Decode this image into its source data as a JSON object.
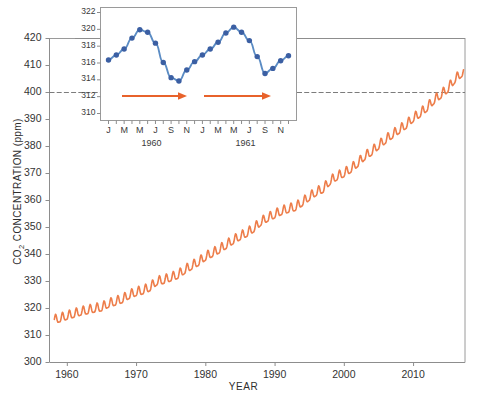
{
  "chart_data": [
    {
      "id": "main",
      "type": "line",
      "title": "",
      "xlabel": "YEAR",
      "ylabel": "CO2 CONCENTRATION (ppm)",
      "ylabel_parts": {
        "pre": "CO",
        "sub": "2",
        "post": " CONCENTRATION (ppm)"
      },
      "xlim": [
        1957.5,
        2017.5
      ],
      "ylim": [
        300,
        420
      ],
      "xticks": [
        1960,
        1970,
        1980,
        1990,
        2000,
        2010
      ],
      "xtick_labels": [
        "1960",
        "1970",
        "1980",
        "1990",
        "2000",
        "2010"
      ],
      "yticks": [
        300,
        310,
        320,
        330,
        340,
        350,
        360,
        370,
        380,
        390,
        400,
        410,
        420
      ],
      "ytick_labels": [
        "300",
        "310",
        "320",
        "330",
        "340",
        "350",
        "360",
        "370",
        "380",
        "390",
        "400",
        "410",
        "420"
      ],
      "grid": false,
      "legend": "none",
      "series_color": "#ED7D4A",
      "description": "Keeling curve: monthly mean atmospheric CO2 at Mauna Loa, rising sawtooth with annual seasonal cycle",
      "annual_trend": [
        {
          "year": 1958,
          "value": 315.3
        },
        {
          "year": 1959,
          "value": 315.98
        },
        {
          "year": 1960,
          "value": 316.91
        },
        {
          "year": 1961,
          "value": 317.64
        },
        {
          "year": 1962,
          "value": 318.45
        },
        {
          "year": 1963,
          "value": 318.99
        },
        {
          "year": 1964,
          "value": 319.62
        },
        {
          "year": 1965,
          "value": 320.04
        },
        {
          "year": 1966,
          "value": 321.37
        },
        {
          "year": 1967,
          "value": 322.18
        },
        {
          "year": 1968,
          "value": 323.05
        },
        {
          "year": 1969,
          "value": 324.62
        },
        {
          "year": 1970,
          "value": 325.68
        },
        {
          "year": 1971,
          "value": 326.32
        },
        {
          "year": 1972,
          "value": 327.46
        },
        {
          "year": 1973,
          "value": 329.68
        },
        {
          "year": 1974,
          "value": 330.19
        },
        {
          "year": 1975,
          "value": 331.12
        },
        {
          "year": 1976,
          "value": 332.03
        },
        {
          "year": 1977,
          "value": 333.84
        },
        {
          "year": 1978,
          "value": 335.41
        },
        {
          "year": 1979,
          "value": 336.84
        },
        {
          "year": 1980,
          "value": 338.76
        },
        {
          "year": 1981,
          "value": 340.12
        },
        {
          "year": 1982,
          "value": 341.48
        },
        {
          "year": 1983,
          "value": 343.15
        },
        {
          "year": 1984,
          "value": 344.87
        },
        {
          "year": 1985,
          "value": 346.35
        },
        {
          "year": 1986,
          "value": 347.61
        },
        {
          "year": 1987,
          "value": 349.31
        },
        {
          "year": 1988,
          "value": 351.69
        },
        {
          "year": 1989,
          "value": 353.2
        },
        {
          "year": 1990,
          "value": 354.45
        },
        {
          "year": 1991,
          "value": 355.7
        },
        {
          "year": 1992,
          "value": 356.54
        },
        {
          "year": 1993,
          "value": 357.21
        },
        {
          "year": 1994,
          "value": 358.96
        },
        {
          "year": 1995,
          "value": 360.97
        },
        {
          "year": 1996,
          "value": 362.74
        },
        {
          "year": 1997,
          "value": 363.88
        },
        {
          "year": 1998,
          "value": 366.84
        },
        {
          "year": 1999,
          "value": 368.54
        },
        {
          "year": 2000,
          "value": 369.71
        },
        {
          "year": 2001,
          "value": 371.32
        },
        {
          "year": 2002,
          "value": 373.45
        },
        {
          "year": 2003,
          "value": 375.98
        },
        {
          "year": 2004,
          "value": 377.7
        },
        {
          "year": 2005,
          "value": 379.98
        },
        {
          "year": 2006,
          "value": 382.09
        },
        {
          "year": 2007,
          "value": 384.03
        },
        {
          "year": 2008,
          "value": 385.83
        },
        {
          "year": 2009,
          "value": 387.64
        },
        {
          "year": 2010,
          "value": 390.1
        },
        {
          "year": 2011,
          "value": 391.85
        },
        {
          "year": 2012,
          "value": 394.06
        },
        {
          "year": 2013,
          "value": 396.74
        },
        {
          "year": 2014,
          "value": 398.81
        },
        {
          "year": 2015,
          "value": 401.01
        },
        {
          "year": 2016,
          "value": 404.41
        },
        {
          "year": 2017,
          "value": 406.76
        }
      ],
      "seasonal_amplitude_ppm": 3.2
    },
    {
      "id": "inset",
      "type": "line",
      "title": "",
      "xlabel": "",
      "ylabel": "",
      "ylim": [
        310,
        322
      ],
      "yticks": [
        310,
        312,
        314,
        316,
        318,
        320,
        322
      ],
      "ytick_labels": [
        "310",
        "312",
        "314",
        "316",
        "318",
        "320",
        "322"
      ],
      "xtick_labels": [
        "J",
        "M",
        "M",
        "J",
        "S",
        "N",
        "J",
        "M",
        "M",
        "J",
        "S",
        "N"
      ],
      "year_labels": [
        "1960",
        "1961"
      ],
      "grid": false,
      "legend": "none",
      "marker_color": "#3B5FA3",
      "line_color": "#5B8CC4",
      "description": "Monthly mean CO2 for 1960-1961 showing two full annual seasonal cycles",
      "months": [
        "J",
        "F",
        "M",
        "A",
        "M",
        "J",
        "J",
        "A",
        "S",
        "O",
        "N",
        "D",
        "J",
        "F",
        "M",
        "A",
        "M",
        "J",
        "J",
        "A",
        "S",
        "O",
        "N",
        "D"
      ],
      "values": [
        316.3,
        316.9,
        317.6,
        318.9,
        319.9,
        319.6,
        318.3,
        316.0,
        314.2,
        313.8,
        315.1,
        316.1,
        316.9,
        317.6,
        318.4,
        319.5,
        320.2,
        319.6,
        318.6,
        316.7,
        314.7,
        315.3,
        316.2,
        316.8
      ],
      "annotations": [
        {
          "type": "arrow",
          "label": "annual-cycle-arrow-1960",
          "color": "#E8622B",
          "from_month": "M",
          "to_month": "S",
          "y": 313.0
        },
        {
          "type": "arrow",
          "label": "annual-cycle-arrow-1961",
          "color": "#E8622B",
          "from_month": "M",
          "to_month": "S",
          "y": 313.0
        }
      ]
    }
  ],
  "figure": {
    "background": "#ffffff",
    "accent_orange": "#ED7D4A",
    "accent_blue": "#3B5FA3",
    "arrow_orange": "#E8622B",
    "axis_gray": "#8d8d8d"
  }
}
